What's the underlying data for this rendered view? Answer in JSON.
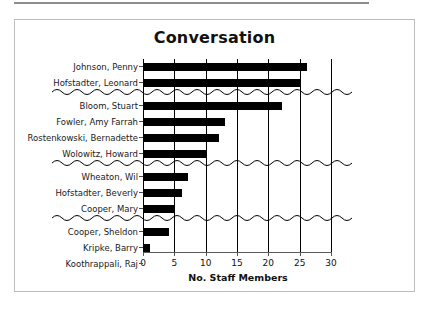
{
  "chart_data": {
    "type": "bar",
    "orientation": "horizontal",
    "title": "Conversation",
    "xlabel": "No. Staff Members",
    "ylabel": "",
    "xlim": [
      0,
      30
    ],
    "xticks": [
      0,
      5,
      10,
      15,
      20,
      25,
      30
    ],
    "grid": "vertical",
    "legend": "none",
    "bar_color": "#000000",
    "categories": [
      "Johnson, Penny",
      "Hofstadter, Leonard",
      "Bloom, Stuart",
      "Fowler, Amy Farrah",
      "Rostenkowski, Bernadette",
      "Wolowitz, Howard",
      "Wheaton, Wil",
      "Hofstadter, Beverly",
      "Cooper, Mary",
      "Cooper, Sheldon",
      "Kripke, Barry",
      "Koothrappali, Raj"
    ],
    "values": [
      26,
      25,
      22,
      13,
      12,
      10,
      7,
      6,
      5,
      4,
      1,
      0
    ],
    "group_breaks_after": [
      "Hofstadter, Leonard",
      "Wolowitz, Howard",
      "Cooper, Mary"
    ],
    "annotations": [
      "wavy separator line after row 2",
      "wavy separator line after row 6",
      "wavy separator line after row 9"
    ]
  },
  "frame": {
    "border_color": "#bdbdbd",
    "background": "#ffffff"
  }
}
